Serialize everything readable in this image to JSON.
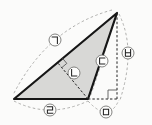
{
  "figure": {
    "kind": "geometry-diagram",
    "background_color": "#fbfbfa",
    "triangle": {
      "fill_color": "#d8d8d6",
      "stroke_color": "#161616",
      "stroke_width": 2.2,
      "vertices": [
        [
          14,
          99
        ],
        [
          117,
          13
        ],
        [
          88,
          99
        ]
      ]
    },
    "dashed_lines": [
      {
        "name": "perpendicular-from-bottom-vertex",
        "from": [
          88,
          99
        ],
        "to": [
          57.6,
          62.6
        ]
      },
      {
        "name": "vertical-height-line",
        "from": [
          117,
          13
        ],
        "to": [
          117,
          99
        ]
      },
      {
        "name": "base-extension-line",
        "from": [
          88,
          99
        ],
        "to": [
          117,
          99
        ]
      }
    ],
    "right_angle_markers": [
      {
        "name": "right-angle-on-left-side",
        "points": [
          [
            62.6,
            58.4
          ],
          [
            66.8,
            63.4
          ],
          [
            61.8,
            67.6
          ]
        ]
      },
      {
        "name": "right-angle-at-extension",
        "points": [
          [
            108,
            99
          ],
          [
            108,
            90
          ],
          [
            117,
            90
          ]
        ]
      }
    ],
    "label_arcs": [
      {
        "label": "ㄱ",
        "from": [
          112,
          10
        ],
        "control": [
          47.5,
          27.5
        ],
        "to": [
          13,
          95
        ]
      },
      {
        "label": "ㄷ",
        "from": [
          115,
          16
        ],
        "control": [
          101.5,
          65.5
        ],
        "to": [
          90,
          97
        ]
      },
      {
        "label": "ㄹ",
        "from": [
          14,
          101
        ],
        "control": [
          49,
          119
        ],
        "to": [
          88,
          101
        ]
      },
      {
        "label": "ㅁ",
        "from": [
          88,
          101
        ],
        "control": [
          108.5,
          123.5
        ],
        "to": [
          119,
          100
        ]
      },
      {
        "label": "ㅂ",
        "from": [
          119,
          14
        ],
        "control": [
          136.5,
          49
        ],
        "to": [
          120,
          100
        ]
      }
    ],
    "labels": [
      {
        "char": "ㄱ",
        "name": "label-giyeok",
        "cx": 55,
        "cy": 40
      },
      {
        "char": "ㄴ",
        "name": "label-nieun",
        "cx": 74,
        "cy": 73
      },
      {
        "char": "ㄷ",
        "name": "label-digeut",
        "cx": 102,
        "cy": 61
      },
      {
        "char": "ㄹ",
        "name": "label-rieul",
        "cx": 50,
        "cy": 110
      },
      {
        "char": "ㅁ",
        "name": "label-mieum",
        "cx": 106,
        "cy": 112
      },
      {
        "char": "ㅂ",
        "name": "label-bieup",
        "cx": 128,
        "cy": 53
      }
    ],
    "style": {
      "dashed_line_color": "#222222",
      "arc_color": "#a6a6a4",
      "marker_color": "#5a5a5a",
      "circle_fill": "#fdfdfc",
      "circle_stroke": "#767674",
      "glyph_color": "#222222"
    }
  }
}
